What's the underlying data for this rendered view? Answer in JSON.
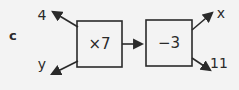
{
  "diagram": {
    "part_label": "c",
    "function_machine": {
      "left_top_value": "4",
      "left_bottom_value": "y",
      "operation_box_1": "×7",
      "operation_box_2": "−3",
      "right_top_value": "x",
      "right_bottom_value": "11"
    },
    "colors": {
      "stroke": "#2a2a2a",
      "background": "#f3f3f3"
    }
  }
}
